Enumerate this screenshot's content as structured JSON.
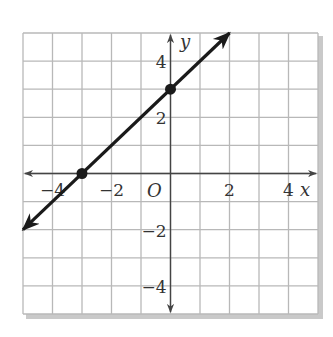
{
  "chart_data": {
    "type": "line",
    "title": "",
    "xlabel": "x",
    "ylabel": "y",
    "origin_label": "O",
    "xlim": [
      -5,
      5
    ],
    "ylim": [
      -5,
      5
    ],
    "grid": true,
    "grid_step": 1,
    "x_ticks": [
      {
        "value": -4,
        "label": "−4"
      },
      {
        "value": -2,
        "label": "−2"
      },
      {
        "value": 2,
        "label": "2"
      },
      {
        "value": 4,
        "label": "4"
      }
    ],
    "y_ticks": [
      {
        "value": 4,
        "label": "4"
      },
      {
        "value": 2,
        "label": "2"
      },
      {
        "value": -2,
        "label": "−2"
      },
      {
        "value": -4,
        "label": "−4"
      }
    ],
    "series": [
      {
        "name": "line",
        "equation": "y = x + 3",
        "slope": 1,
        "intercept": 3,
        "x": [
          -5,
          2
        ],
        "y": [
          -2,
          5
        ],
        "arrows": "both",
        "color": "#1a1a1a"
      }
    ],
    "points": [
      {
        "x": 0,
        "y": 3,
        "label": "y-intercept"
      },
      {
        "x": -3,
        "y": 0,
        "label": "x-intercept"
      }
    ]
  },
  "colors": {
    "grid": "#b8b8b8",
    "axis": "#444444",
    "line": "#1a1a1a",
    "shadow": "#c9c9c9"
  }
}
